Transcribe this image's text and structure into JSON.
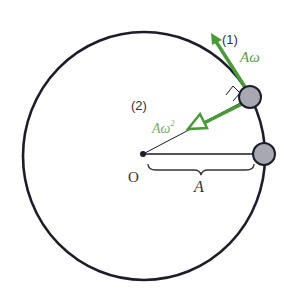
{
  "diagram": {
    "labels": {
      "velocity_index": "(1)",
      "velocity": "Aω",
      "accel_index": "(2)",
      "accel_base": "Aω",
      "accel_exp": "2",
      "origin": "O",
      "radius": "A"
    },
    "colors": {
      "circle": "#1c1c2a",
      "arrow": "#4a9a3a",
      "ball": "#a8a8b0",
      "text": "#333333",
      "green_text": "#5a9a4a"
    }
  }
}
